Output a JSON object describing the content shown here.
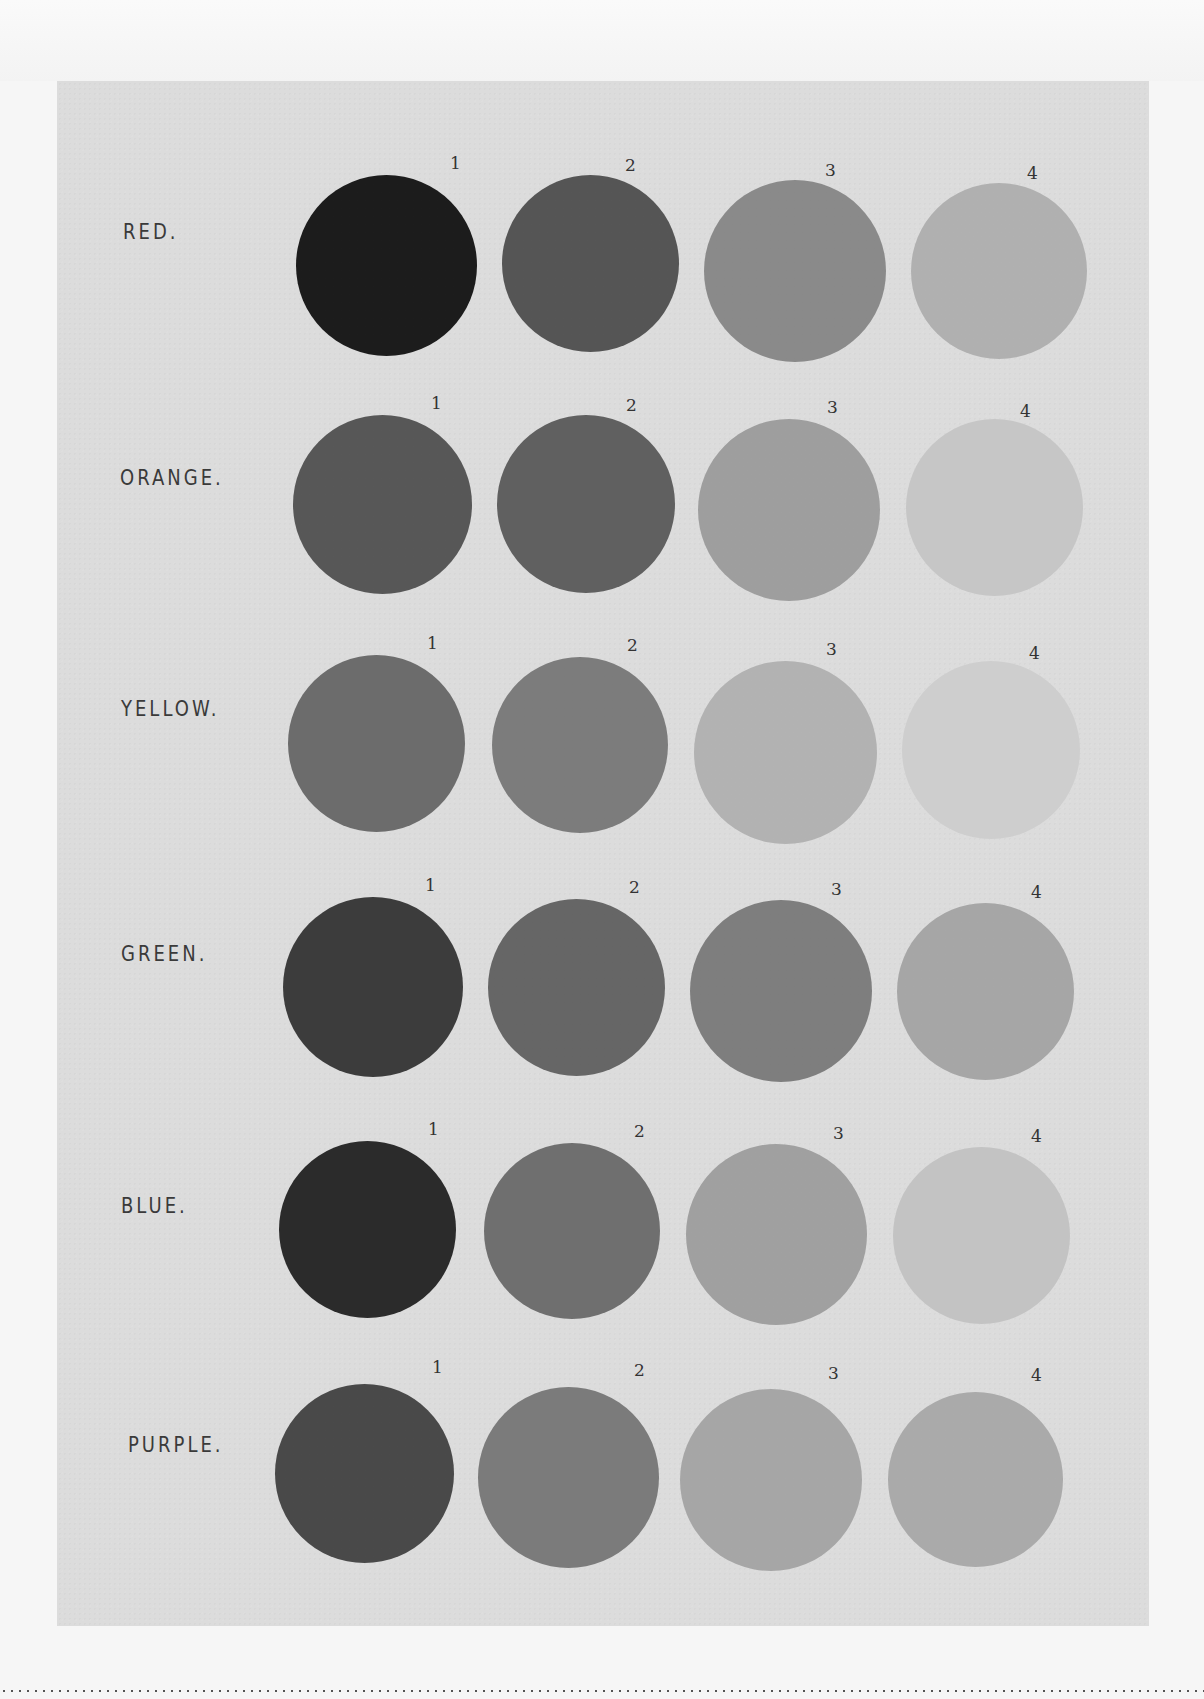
{
  "plate": {
    "background": "#dcdcdc",
    "rows": [
      {
        "label": "RED.",
        "label_pos": [
          123,
          219
        ],
        "swatches": [
          {
            "number": "1",
            "x": 296,
            "y": 175,
            "d": 181,
            "num_x": 450,
            "num_y": 153,
            "color": "#1c1c1c"
          },
          {
            "number": "2",
            "x": 502,
            "y": 175,
            "d": 177,
            "num_x": 625,
            "num_y": 155,
            "color": "#555555"
          },
          {
            "number": "3",
            "x": 704,
            "y": 180,
            "d": 182,
            "num_x": 825,
            "num_y": 160,
            "color": "#8a8a8a"
          },
          {
            "number": "4",
            "x": 911,
            "y": 183,
            "d": 176,
            "num_x": 1027,
            "num_y": 163,
            "color": "#b0b0b0"
          }
        ]
      },
      {
        "label": "ORANGE.",
        "label_pos": [
          120,
          465
        ],
        "swatches": [
          {
            "number": "1",
            "x": 293,
            "y": 415,
            "d": 179,
            "num_x": 431,
            "num_y": 393,
            "color": "#575757"
          },
          {
            "number": "2",
            "x": 497,
            "y": 415,
            "d": 178,
            "num_x": 626,
            "num_y": 395,
            "color": "#606060"
          },
          {
            "number": "3",
            "x": 698,
            "y": 419,
            "d": 182,
            "num_x": 827,
            "num_y": 397,
            "color": "#9e9e9e"
          },
          {
            "number": "4",
            "x": 906,
            "y": 419,
            "d": 177,
            "num_x": 1020,
            "num_y": 401,
            "color": "#c6c6c6"
          }
        ]
      },
      {
        "label": "YELLOW.",
        "label_pos": [
          121,
          696
        ],
        "swatches": [
          {
            "number": "1",
            "x": 288,
            "y": 655,
            "d": 177,
            "num_x": 427,
            "num_y": 633,
            "color": "#6c6c6c"
          },
          {
            "number": "2",
            "x": 492,
            "y": 657,
            "d": 176,
            "num_x": 627,
            "num_y": 635,
            "color": "#7c7c7c"
          },
          {
            "number": "3",
            "x": 694,
            "y": 661,
            "d": 183,
            "num_x": 826,
            "num_y": 639,
            "color": "#b2b2b2"
          },
          {
            "number": "4",
            "x": 902,
            "y": 661,
            "d": 178,
            "num_x": 1029,
            "num_y": 643,
            "color": "#cecece"
          }
        ]
      },
      {
        "label": "GREEN.",
        "label_pos": [
          121,
          941
        ],
        "swatches": [
          {
            "number": "1",
            "x": 283,
            "y": 897,
            "d": 180,
            "num_x": 425,
            "num_y": 875,
            "color": "#3c3c3c"
          },
          {
            "number": "2",
            "x": 488,
            "y": 899,
            "d": 177,
            "num_x": 629,
            "num_y": 877,
            "color": "#666666"
          },
          {
            "number": "3",
            "x": 690,
            "y": 900,
            "d": 182,
            "num_x": 831,
            "num_y": 879,
            "color": "#7e7e7e"
          },
          {
            "number": "4",
            "x": 897,
            "y": 903,
            "d": 177,
            "num_x": 1031,
            "num_y": 882,
            "color": "#a6a6a6"
          }
        ]
      },
      {
        "label": "BLUE.",
        "label_pos": [
          121,
          1193
        ],
        "swatches": [
          {
            "number": "1",
            "x": 279,
            "y": 1141,
            "d": 177,
            "num_x": 428,
            "num_y": 1119,
            "color": "#2b2b2b"
          },
          {
            "number": "2",
            "x": 484,
            "y": 1143,
            "d": 176,
            "num_x": 634,
            "num_y": 1121,
            "color": "#6f6f6f"
          },
          {
            "number": "3",
            "x": 686,
            "y": 1144,
            "d": 181,
            "num_x": 833,
            "num_y": 1123,
            "color": "#a0a0a0"
          },
          {
            "number": "4",
            "x": 893,
            "y": 1147,
            "d": 177,
            "num_x": 1031,
            "num_y": 1126,
            "color": "#c3c3c3"
          }
        ]
      },
      {
        "label": "PURPLE.",
        "label_pos": [
          128,
          1432
        ],
        "swatches": [
          {
            "number": "1",
            "x": 275,
            "y": 1384,
            "d": 179,
            "num_x": 432,
            "num_y": 1357,
            "color": "#494949"
          },
          {
            "number": "2",
            "x": 478,
            "y": 1387,
            "d": 181,
            "num_x": 634,
            "num_y": 1360,
            "color": "#7b7b7b"
          },
          {
            "number": "3",
            "x": 680,
            "y": 1389,
            "d": 182,
            "num_x": 828,
            "num_y": 1363,
            "color": "#a6a6a6"
          },
          {
            "number": "4",
            "x": 888,
            "y": 1392,
            "d": 175,
            "num_x": 1031,
            "num_y": 1365,
            "color": "#aaaaaa"
          }
        ]
      }
    ]
  }
}
